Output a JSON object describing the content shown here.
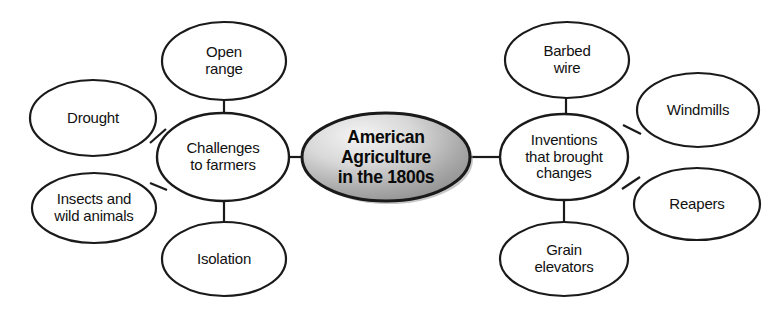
{
  "diagram": {
    "type": "concept-map",
    "title_node": {
      "id": "center",
      "label": "American\nAgriculture\nin the 1800s",
      "shape": "ellipse",
      "fill_start": "#f2f2f2",
      "fill_end": "#8e8e8e",
      "stroke": "#1a1a1a",
      "cx": 386,
      "cy": 157,
      "rx": 84,
      "ry": 44
    },
    "branches": [
      {
        "id": "challenges",
        "label": "Challenges\nto farmers",
        "shape": "ellipse",
        "fill": "#ffffff",
        "stroke": "#1a1a1a",
        "cx": 223,
        "cy": 157,
        "rx": 66,
        "ry": 44,
        "children": [
          {
            "id": "open-range",
            "label": "Open\nrange",
            "cx": 224,
            "cy": 61,
            "rx": 62,
            "ry": 39
          },
          {
            "id": "drought",
            "label": "Drought",
            "cx": 93,
            "cy": 118,
            "rx": 63,
            "ry": 38
          },
          {
            "id": "insects-wild-animals",
            "label": "Insects and\nwild animals",
            "cx": 94,
            "cy": 208,
            "rx": 62,
            "ry": 35
          },
          {
            "id": "isolation",
            "label": "Isolation",
            "cx": 224,
            "cy": 259,
            "rx": 62,
            "ry": 37
          }
        ]
      },
      {
        "id": "inventions",
        "label": "Inventions\nthat brought\nchanges",
        "shape": "ellipse",
        "fill": "#ffffff",
        "stroke": "#1a1a1a",
        "cx": 564,
        "cy": 157,
        "rx": 64,
        "ry": 43,
        "children": [
          {
            "id": "barbed-wire",
            "label": "Barbed\nwire",
            "cx": 567,
            "cy": 60,
            "rx": 62,
            "ry": 38
          },
          {
            "id": "windmills",
            "label": "Windmills",
            "cx": 698,
            "cy": 110,
            "rx": 61,
            "ry": 37
          },
          {
            "id": "reapers",
            "label": "Reapers",
            "cx": 697,
            "cy": 204,
            "rx": 63,
            "ry": 36
          },
          {
            "id": "grain-elevators",
            "label": "Grain\nelevators",
            "cx": 564,
            "cy": 259,
            "rx": 64,
            "ry": 37
          }
        ]
      }
    ],
    "connectors": [
      {
        "id": "challenges-to-center",
        "x1": 289,
        "y1": 157,
        "x2": 302,
        "y2": 157
      },
      {
        "id": "center-to-inventions",
        "x1": 470,
        "y1": 157,
        "x2": 500,
        "y2": 157
      },
      {
        "id": "open-range-to-challenges",
        "x1": 224,
        "y1": 100,
        "x2": 224,
        "y2": 114
      },
      {
        "id": "drought-to-challenges",
        "x1": 150,
        "y1": 143,
        "x2": 166,
        "y2": 129
      },
      {
        "id": "insects-to-challenges",
        "x1": 150,
        "y1": 183,
        "x2": 167,
        "y2": 190
      },
      {
        "id": "isolation-to-challenges",
        "x1": 224,
        "y1": 200,
        "x2": 224,
        "y2": 222
      },
      {
        "id": "barbed-wire-to-inventions",
        "x1": 566,
        "y1": 98,
        "x2": 566,
        "y2": 114
      },
      {
        "id": "windmills-to-inventions",
        "x1": 641,
        "y1": 134,
        "x2": 623,
        "y2": 125
      },
      {
        "id": "reapers-to-inventions",
        "x1": 640,
        "y1": 177,
        "x2": 622,
        "y2": 189
      },
      {
        "id": "grain-elevators-to-inventions",
        "x1": 564,
        "y1": 200,
        "x2": 564,
        "y2": 222
      }
    ]
  }
}
